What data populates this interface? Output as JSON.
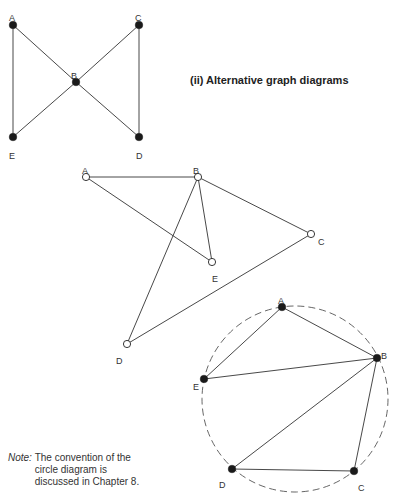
{
  "heading": "(ii) Alternative graph diagrams",
  "note": {
    "label": "Note:",
    "lines": [
      "The convention of the",
      "circle diagram is",
      "discussed in Chapter 8."
    ]
  },
  "graphs": [
    {
      "name": "bowtie-graph",
      "node_style": "filled",
      "nodes": [
        {
          "id": "A",
          "x": 13,
          "y": 25,
          "lx": 9,
          "ly": 14
        },
        {
          "id": "B",
          "x": 76,
          "y": 82,
          "lx": 71,
          "ly": 72
        },
        {
          "id": "C",
          "x": 139,
          "y": 25,
          "lx": 135,
          "ly": 14
        },
        {
          "id": "D",
          "x": 139,
          "y": 137,
          "lx": 136,
          "ly": 152
        },
        {
          "id": "E",
          "x": 13,
          "y": 137,
          "lx": 9,
          "ly": 152
        }
      ],
      "edges": [
        [
          "A",
          "B"
        ],
        [
          "B",
          "C"
        ],
        [
          "A",
          "E"
        ],
        [
          "C",
          "D"
        ],
        [
          "B",
          "E"
        ],
        [
          "B",
          "D"
        ]
      ]
    },
    {
      "name": "open-node-graph",
      "node_style": "open",
      "nodes": [
        {
          "id": "A",
          "x": 86,
          "y": 177,
          "lx": 82,
          "ly": 167
        },
        {
          "id": "B",
          "x": 198,
          "y": 177,
          "lx": 193,
          "ly": 167
        },
        {
          "id": "C",
          "x": 311,
          "y": 234,
          "lx": 318,
          "ly": 238
        },
        {
          "id": "D",
          "x": 127,
          "y": 344,
          "lx": 116,
          "ly": 357
        },
        {
          "id": "E",
          "x": 212,
          "y": 262,
          "lx": 212,
          "ly": 275
        }
      ],
      "edges": [
        [
          "A",
          "B"
        ],
        [
          "A",
          "E"
        ],
        [
          "B",
          "E"
        ],
        [
          "B",
          "C"
        ],
        [
          "B",
          "D"
        ],
        [
          "D",
          "C"
        ]
      ]
    },
    {
      "name": "circle-graph",
      "node_style": "filled",
      "circle": {
        "cx": 295,
        "cy": 399,
        "r": 93
      },
      "nodes": [
        {
          "id": "A",
          "x": 282,
          "y": 307,
          "lx": 278,
          "ly": 297
        },
        {
          "id": "B",
          "x": 377,
          "y": 358,
          "lx": 381,
          "ly": 352
        },
        {
          "id": "C",
          "x": 354,
          "y": 471,
          "lx": 358,
          "ly": 484
        },
        {
          "id": "D",
          "x": 232,
          "y": 469,
          "lx": 219,
          "ly": 481
        },
        {
          "id": "E",
          "x": 204,
          "y": 379,
          "lx": 193,
          "ly": 383
        }
      ],
      "edges": [
        [
          "A",
          "B"
        ],
        [
          "A",
          "E"
        ],
        [
          "E",
          "B"
        ],
        [
          "B",
          "D"
        ],
        [
          "B",
          "C"
        ],
        [
          "D",
          "C"
        ]
      ]
    }
  ]
}
